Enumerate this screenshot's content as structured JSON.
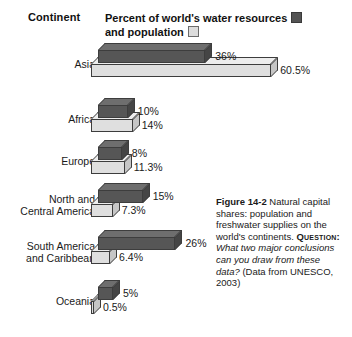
{
  "header": {
    "continent_label": "Continent",
    "legend_line1": "Percent of world's water resources",
    "legend_line2": "and population",
    "swatch_dark_name": "water-resources-swatch",
    "swatch_light_name": "population-swatch",
    "color_dark": "#565656",
    "color_light": "#dfdfdf"
  },
  "caption": {
    "figure_number": "Figure 14-2",
    "text1": "Natural capital shares:  population and freshwater supplies on the world's continents.",
    "question_label": "Question:",
    "question": "What two major conclusions can you draw from these data?",
    "source": "(Data from UNESCO, 2003)"
  },
  "chart_data": {
    "type": "bar",
    "title": "Natural capital shares: population and freshwater supplies on the world's continents",
    "xlabel": "",
    "ylabel": "Continent",
    "orientation": "horizontal",
    "grid": false,
    "legend_position": "top",
    "xlim": [
      0,
      61
    ],
    "categories": [
      "Asia",
      "Africa",
      "Europe",
      "North and Central America",
      "South America and Caribbean",
      "Oceania"
    ],
    "series": [
      {
        "name": "Percent of world's water resources",
        "color": "#565656",
        "values": [
          36,
          10,
          8,
          15,
          26,
          5
        ],
        "labels": [
          "36%",
          "10%",
          "8%",
          "15%",
          "26%",
          "5%"
        ]
      },
      {
        "name": "Percent of world's population",
        "color": "#dfdfdf",
        "values": [
          60.5,
          14,
          11.3,
          7.3,
          6.4,
          0.5
        ],
        "labels": [
          "60.5%",
          "14%",
          "11.3%",
          "7.3%",
          "6.4%",
          "0.5%"
        ]
      }
    ]
  }
}
